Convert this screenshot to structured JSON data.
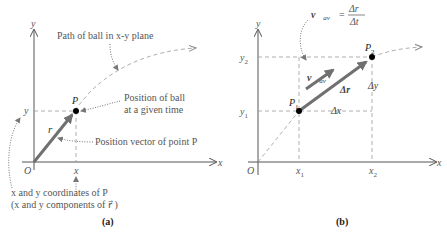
{
  "figure": {
    "panel_a": {
      "caption": "(a)",
      "axes": {
        "x_label": "x",
        "y_label": "y",
        "origin_label": "O"
      },
      "point_label": "P",
      "x_tick_label": "x",
      "y_tick_label": "y",
      "vector_label": "r⃗",
      "annotations": {
        "path": "Path of ball in x-y plane",
        "position_line1": "Position of ball",
        "position_line2": "at a given time",
        "position_vector": "Position vector of point P",
        "coords_line1": "x and y coordinates of P",
        "coords_line2": "(x and y components of r⃗ )"
      }
    },
    "panel_b": {
      "caption": "(b)",
      "axes": {
        "x_label": "x",
        "y_label": "y",
        "origin_label": "O"
      },
      "p1_label": "P",
      "p1_sub": "1",
      "p2_label": "P",
      "p2_sub": "2",
      "x1_label": "x",
      "x1_sub": "1",
      "x2_label": "x",
      "x2_sub": "2",
      "y1_label": "y",
      "y1_sub": "1",
      "y2_label": "y",
      "y2_sub": "2",
      "delta_x": "Δx",
      "delta_y": "Δy",
      "delta_r": "Δr⃗",
      "v_av_label": "v⃗",
      "v_av_sub": "av",
      "formula_lhs": "v⃗",
      "formula_sub": "av",
      "formula_eq": "=",
      "formula_num": "Δr⃗",
      "formula_den": "Δt"
    },
    "colors": {
      "vector": "#707070",
      "axis": "#555555",
      "dashed": "#999999",
      "point": "#000000"
    }
  }
}
